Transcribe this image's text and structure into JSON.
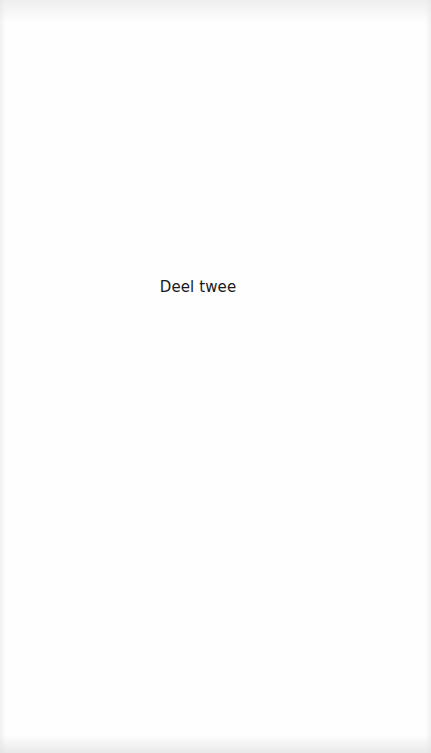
{
  "page": {
    "part_title": "Deel twee",
    "background_color": "#fefefe",
    "text_color": "#1a1a1a"
  }
}
